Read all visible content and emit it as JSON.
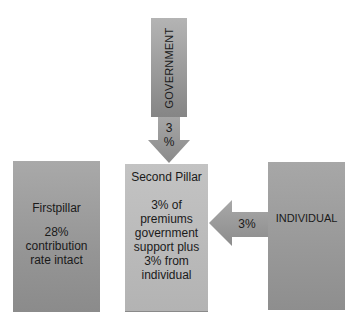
{
  "diagram": {
    "government": {
      "label": "GOVERNMENT",
      "arrow_label_line1": "3",
      "arrow_label_line2": "%"
    },
    "first_pillar": {
      "title": "Firstpillar",
      "body": "28% contribution rate intact"
    },
    "second_pillar": {
      "title": "Second Pillar",
      "body": "3% of premiums government support plus 3% from individual"
    },
    "individual": {
      "label": "INDIVIDUAL",
      "arrow_label": "3%"
    },
    "colors": {
      "box_dark": "#8e8e8e",
      "box_light": "#c3c3c3",
      "arrow": "#9a9a9a",
      "background": "#ffffff"
    }
  }
}
